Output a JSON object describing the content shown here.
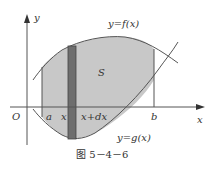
{
  "figure": {
    "caption": "图 5－4－6",
    "labels": {
      "y_axis": "y",
      "x_axis": "x",
      "origin": "O",
      "a": "a",
      "x": "x",
      "x_dx": "x+dx",
      "b": "b",
      "region": "S",
      "upper_curve": "y=f(x)",
      "lower_curve": "y=g(x)"
    },
    "colors": {
      "region_fill": "#c8c8c8",
      "strip_fill": "#6e6e6e",
      "line": "#555555"
    }
  }
}
